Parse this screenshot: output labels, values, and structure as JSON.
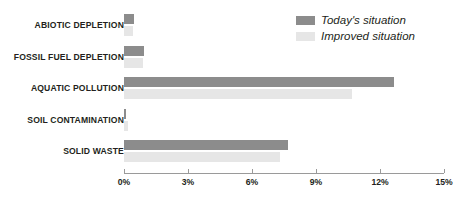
{
  "chart_data": {
    "type": "bar",
    "orientation": "horizontal",
    "title": "",
    "xlabel": "",
    "ylabel": "",
    "xlim": [
      0,
      15
    ],
    "xticks": [
      0,
      3,
      6,
      9,
      12,
      15
    ],
    "xtick_labels": [
      "0%",
      "3%",
      "6%",
      "9%",
      "12%",
      "15%"
    ],
    "grid": false,
    "legend_position": "top-right",
    "categories": [
      "ABIOTIC DEPLETION",
      "FOSSIL FUEL DEPLETION",
      "AQUATIC POLLUTION",
      "SOIL CONTAMINATION",
      "SOLID WASTE"
    ],
    "series": [
      {
        "name": "Today's situation",
        "color": "#8c8c8c",
        "values": [
          0.45,
          0.95,
          12.65,
          0.1,
          7.7
        ]
      },
      {
        "name": "Improved situation",
        "color": "#e6e6e6",
        "values": [
          0.4,
          0.9,
          10.7,
          0.2,
          7.3
        ]
      }
    ]
  },
  "legend": {
    "items": [
      {
        "label": "Today's situation",
        "color": "#8c8c8c"
      },
      {
        "label": "Improved situation",
        "color": "#e6e6e6"
      }
    ]
  },
  "colors": {
    "series_dark": "#8c8c8c",
    "series_light": "#e6e6e6",
    "text": "#231f20",
    "axis": "#9a9a9a",
    "background": "#ffffff"
  }
}
